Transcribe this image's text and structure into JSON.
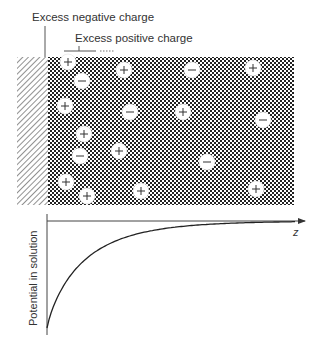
{
  "labels": {
    "negative_charge": "Excess negative charge",
    "positive_charge": "Excess positive charge",
    "y_axis": "Potential in solution",
    "x_axis": "z"
  },
  "regions": {
    "electrode": {
      "pattern": "diagonal-hatch",
      "x": 17,
      "y": 57,
      "w": 31,
      "h": 148
    },
    "solution": {
      "pattern": "checkerboard",
      "x": 48,
      "y": 57,
      "w": 246,
      "h": 148
    }
  },
  "ions": [
    {
      "sign": "+",
      "x": 68,
      "y": 62
    },
    {
      "sign": "-",
      "x": 82,
      "y": 81
    },
    {
      "sign": "+",
      "x": 124,
      "y": 70
    },
    {
      "sign": "-",
      "x": 192,
      "y": 70
    },
    {
      "sign": "+",
      "x": 253,
      "y": 68
    },
    {
      "sign": "+",
      "x": 65,
      "y": 106
    },
    {
      "sign": "-",
      "x": 130,
      "y": 112
    },
    {
      "sign": "+",
      "x": 183,
      "y": 112
    },
    {
      "sign": "-",
      "x": 263,
      "y": 120
    },
    {
      "sign": "+",
      "x": 84,
      "y": 134
    },
    {
      "sign": "-",
      "x": 80,
      "y": 156
    },
    {
      "sign": "+",
      "x": 119,
      "y": 151
    },
    {
      "sign": "-",
      "x": 207,
      "y": 162
    },
    {
      "sign": "+",
      "x": 66,
      "y": 182
    },
    {
      "sign": "+",
      "x": 87,
      "y": 196
    },
    {
      "sign": "+",
      "x": 141,
      "y": 191
    },
    {
      "sign": "+",
      "x": 256,
      "y": 189
    }
  ],
  "chart_data": {
    "type": "line",
    "title": "",
    "xlabel": "z",
    "ylabel": "Potential in solution",
    "x": [
      0,
      0.05,
      0.1,
      0.2,
      0.3,
      0.4,
      0.5,
      0.6,
      0.7,
      0.8,
      0.9,
      1.0
    ],
    "values": [
      -1.0,
      -0.78,
      -0.61,
      -0.37,
      -0.22,
      -0.14,
      -0.08,
      -0.05,
      -0.03,
      -0.02,
      -0.01,
      0.0
    ],
    "grid": false,
    "legend": null
  },
  "colors": {
    "line": "#333333",
    "ion_fill": "#ffffff",
    "checker_dark": "#222222",
    "checker_light": "#ffffff"
  }
}
